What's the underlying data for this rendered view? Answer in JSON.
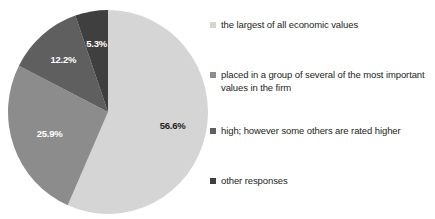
{
  "chart_data": {
    "type": "pie",
    "title": "",
    "subtitle": "",
    "xlabel": "",
    "ylabel": "",
    "grid": false,
    "legend_position": "right",
    "categories": [
      "the largest of all economic values",
      "placed in a group of several of the most important values in the firm",
      "high; however some others are rated higher",
      "other responses"
    ],
    "values": [
      56.6,
      25.9,
      12.2,
      5.3
    ],
    "data_labels": [
      "56.6%",
      "25.9%",
      "12.2%",
      "5.3%"
    ],
    "colors": [
      "#d5d5d5",
      "#8c8c8c",
      "#5f5f5f",
      "#3f3f3f"
    ],
    "label_text_colors": [
      "#231f20",
      "#ffffff",
      "#ffffff",
      "#ffffff"
    ],
    "units": "percent",
    "start_angle_deg": 0,
    "direction": "clockwise"
  },
  "legend": {
    "items": [
      {
        "label": "the largest of all economic values",
        "color": "#d5d5d5"
      },
      {
        "label": "placed in a group of several of the most important values in the firm",
        "color": "#8c8c8c"
      },
      {
        "label": "high; however some others are rated higher",
        "color": "#5f5f5f"
      },
      {
        "label": "other responses",
        "color": "#3f3f3f"
      }
    ]
  },
  "pie": {
    "slices": [
      {
        "label": "56.6%",
        "value": 56.6,
        "color": "#d5d5d5"
      },
      {
        "label": "25.9%",
        "value": 25.9,
        "color": "#8c8c8c"
      },
      {
        "label": "12.2%",
        "value": 12.2,
        "color": "#5f5f5f"
      },
      {
        "label": "5.3%",
        "value": 5.3,
        "color": "#3f3f3f"
      }
    ]
  }
}
